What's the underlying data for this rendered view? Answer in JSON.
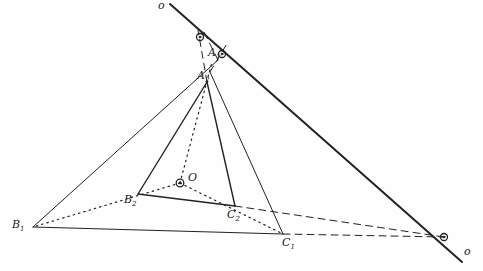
{
  "diagram": {
    "title": "",
    "ink_color": "#222222",
    "points": {
      "B1": {
        "label": "B",
        "sub": "1",
        "x": 33,
        "y": 227
      },
      "C1": {
        "label": "C",
        "sub": "1",
        "x": 283,
        "y": 234
      },
      "A1": {
        "label": "A",
        "sub": "1",
        "x": 218,
        "y": 60
      },
      "A2": {
        "label": "A",
        "sub": "2",
        "x": 207,
        "y": 82
      },
      "B2": {
        "label": "B",
        "sub": "2",
        "x": 138,
        "y": 194
      },
      "C2": {
        "label": "C",
        "sub": "2",
        "x": 235,
        "y": 206
      },
      "O": {
        "label": "O",
        "sub": "",
        "x": 180,
        "y": 183
      }
    },
    "axis_line": {
      "label": "o",
      "x1": 170,
      "y1": 4,
      "x2": 462,
      "y2": 262
    },
    "intersections": [
      {
        "name": "AB-intersection",
        "x": 200,
        "y": 37
      },
      {
        "name": "AC-intersection",
        "x": 222,
        "y": 54
      },
      {
        "name": "BC-intersection",
        "x": 444,
        "y": 237
      }
    ],
    "line_label_top": "o",
    "line_label_bottom": "o"
  }
}
